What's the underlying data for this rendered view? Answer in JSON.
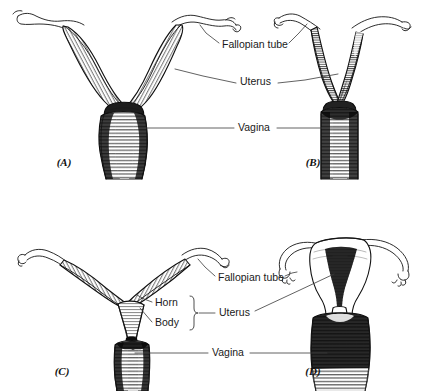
{
  "figure": {
    "background_color": "#ffffff",
    "ink_color": "#111111",
    "leader_color": "#3a3a3a",
    "style": "black-and-white line engraving with hatching"
  },
  "panels": [
    {
      "id": "A",
      "label": "(A)",
      "label_x": 64,
      "label_y": 163,
      "description": "Duplex / bicornuate uterus with long widely splayed V-shaped horns and a large bulbous vagina"
    },
    {
      "id": "B",
      "label": "(B)",
      "label_x": 313,
      "label_y": 163,
      "description": "Bicornuate uterus with short narrow nearly vertical horns meeting in a deep V above the vagina"
    },
    {
      "id": "C",
      "label": "(C)",
      "label_x": 62,
      "label_y": 372,
      "description": "Bicornuate uterus with long horizontal horns, a distinct uterine body and a narrow elongated vagina"
    },
    {
      "id": "D",
      "label": "(D)",
      "label_x": 313,
      "label_y": 372,
      "description": "Simplex human uterus, triangular body with arching fallopian tubes and a broad vagina"
    }
  ],
  "labels": {
    "top": [
      {
        "name": "fallopian-tube",
        "text": "Fallopian tube",
        "x": 222,
        "y": 45,
        "anchor": "start"
      },
      {
        "name": "uterus",
        "text": "Uterus",
        "x": 240,
        "y": 82,
        "anchor": "start"
      },
      {
        "name": "vagina",
        "text": "Vagina",
        "x": 238,
        "y": 128,
        "anchor": "start"
      }
    ],
    "bottom": [
      {
        "name": "fallopian-tube",
        "text": "Fallopian tube",
        "x": 218,
        "y": 278,
        "anchor": "start"
      },
      {
        "name": "horn",
        "text": "Horn",
        "x": 155,
        "y": 303,
        "anchor": "start"
      },
      {
        "name": "body",
        "text": "Body",
        "x": 155,
        "y": 323,
        "anchor": "start"
      },
      {
        "name": "uterus",
        "text": "Uterus",
        "x": 219,
        "y": 313,
        "anchor": "start"
      },
      {
        "name": "vagina",
        "text": "Vagina",
        "x": 212,
        "y": 353,
        "anchor": "start"
      }
    ]
  }
}
